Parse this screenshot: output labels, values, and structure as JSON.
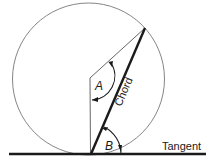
{
  "diagram": {
    "labels": {
      "angle_a": "A",
      "angle_b": "B",
      "chord": "Chord",
      "tangent": "Tangent"
    },
    "colors": {
      "line": "#1a1a1a",
      "circle": "#666666",
      "background": "#ffffff"
    }
  }
}
